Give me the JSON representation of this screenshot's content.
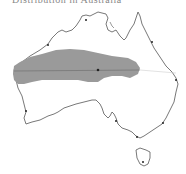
{
  "map": {
    "title": "Distribution in Australia",
    "region": "Australia",
    "range_fill": "#9a9a9a",
    "outline_color": "#555555",
    "line_color": "#666666",
    "background": "#ffffff",
    "features": {
      "shaded_range": "species distribution range",
      "latitude_line": "horizontal reference line across continent",
      "markers": "city location dots"
    }
  }
}
